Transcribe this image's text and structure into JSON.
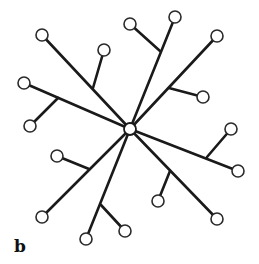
{
  "panel_label": "b",
  "diagram": {
    "type": "tree",
    "center": {
      "x": 130,
      "y": 129,
      "r": 6
    },
    "node_radius": 6,
    "colors": {
      "stroke": "#1a1a1a",
      "node_fill": "#ffffff"
    },
    "branches": [
      {
        "id": "branch-top-left",
        "leaf": {
          "x": 42,
          "y": 35
        },
        "fork": {
          "x": 93,
          "y": 88
        },
        "side_leaf": {
          "x": 104,
          "y": 50
        }
      },
      {
        "id": "branch-left",
        "leaf": {
          "x": 24,
          "y": 83
        },
        "fork": {
          "x": 58,
          "y": 98
        },
        "side_leaf": {
          "x": 30,
          "y": 126
        }
      },
      {
        "id": "branch-lower-left",
        "leaf": {
          "x": 42,
          "y": 217
        },
        "fork": {
          "x": 89,
          "y": 169
        },
        "side_leaf": {
          "x": 57,
          "y": 156
        }
      },
      {
        "id": "branch-bottom",
        "leaf": {
          "x": 86,
          "y": 239
        },
        "fork": {
          "x": 101,
          "y": 205
        },
        "side_leaf": {
          "x": 125,
          "y": 231
        }
      },
      {
        "id": "branch-bottom-right",
        "leaf": {
          "x": 217,
          "y": 219
        },
        "fork": {
          "x": 170,
          "y": 171
        },
        "side_leaf": {
          "x": 158,
          "y": 201
        }
      },
      {
        "id": "branch-right",
        "leaf": {
          "x": 238,
          "y": 171
        },
        "fork": {
          "x": 207,
          "y": 157
        },
        "side_leaf": {
          "x": 231,
          "y": 129
        }
      },
      {
        "id": "branch-upper-right",
        "leaf": {
          "x": 217,
          "y": 36
        },
        "fork": {
          "x": 169,
          "y": 88
        },
        "side_leaf": {
          "x": 203,
          "y": 97
        }
      },
      {
        "id": "branch-top",
        "leaf": {
          "x": 175,
          "y": 17
        },
        "fork": {
          "x": 160,
          "y": 51
        },
        "side_leaf": {
          "x": 130,
          "y": 24
        }
      }
    ]
  }
}
